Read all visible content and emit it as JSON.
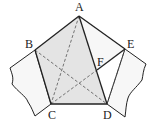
{
  "diagram": {
    "type": "geometry-figure",
    "colors": {
      "shade": "#e4e4e4",
      "paper": "#f7f7f7",
      "line": "#222222",
      "dash": "#555555"
    },
    "points": {
      "A": {
        "label": "A",
        "x": 79,
        "y": 16
      },
      "B": {
        "label": "B",
        "x": 35,
        "y": 50
      },
      "C": {
        "label": "C",
        "x": 51,
        "y": 104
      },
      "D": {
        "label": "D",
        "x": 107,
        "y": 104
      },
      "E": {
        "label": "E",
        "x": 125,
        "y": 49
      },
      "F": {
        "label": "F",
        "x": 97,
        "y": 70
      }
    },
    "solid_segments": [
      "AB",
      "BC",
      "CD",
      "AD",
      "AE",
      "FE"
    ],
    "dashed_segments": [
      "AC",
      "BD",
      "CF",
      "ED"
    ]
  }
}
